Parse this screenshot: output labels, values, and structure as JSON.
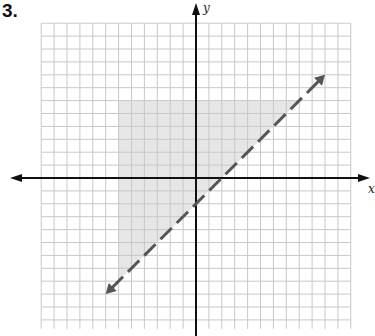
{
  "problem": {
    "number": "3."
  },
  "graph": {
    "x_axis_label": "x",
    "y_axis_label": "y",
    "grid": {
      "x_min": -12,
      "x_max": 12,
      "y_min": -12,
      "y_max": 12,
      "step": 1
    },
    "boundary_line": {
      "equation": "y = x - 2",
      "style": "dashed",
      "from": [
        -7,
        -9
      ],
      "to": [
        10,
        8
      ]
    },
    "shaded_region": {
      "description": "x >= -6, y <= 6, y > x - 2",
      "vertices": [
        [
          -6,
          6
        ],
        [
          8,
          6
        ],
        [
          -6,
          -8
        ]
      ]
    },
    "colors": {
      "grid": "#c8c8c8",
      "axis": "#111111",
      "line": "#555555",
      "shade": "#e6e6e6"
    }
  }
}
